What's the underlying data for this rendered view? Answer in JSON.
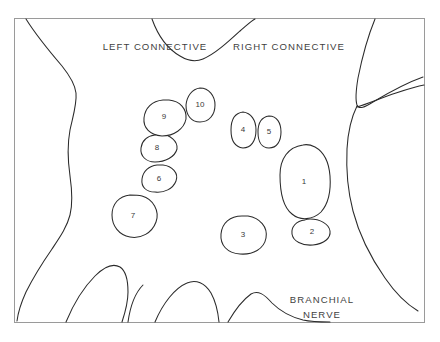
{
  "figure": {
    "background_color": "#ffffff",
    "line_color": "#2b2b2b",
    "frame_color": "#9a9a9a",
    "label_color": "#3f3f3f"
  },
  "region_labels": [
    {
      "id": "left-connective",
      "text": "LEFT CONNECTIVE",
      "x": 155,
      "y": 47
    },
    {
      "id": "right-connective",
      "text": "RIGHT CONNECTIVE",
      "x": 289,
      "y": 47
    },
    {
      "id": "branchial-nerve-line1",
      "text": "BRANCHIAL",
      "x": 322,
      "y": 300
    },
    {
      "id": "branchial-nerve-line2",
      "text": "NERVE",
      "x": 322,
      "y": 315
    }
  ],
  "blobs": [
    {
      "id": "blob-1",
      "label": "1",
      "cx": 304,
      "cy": 182,
      "path": "M 303 145 C 288 147, 280 159, 280 175 C 280 192, 283 207, 292 214 C 300 221, 313 220, 321 212 C 329 203, 331 190, 330 176 C 329 163, 324 152, 315 147 C 311 145, 307 144, 303 145 Z"
    },
    {
      "id": "blob-2",
      "label": "2",
      "cx": 312,
      "cy": 232,
      "path": "M 305 220 C 296 221, 291 227, 292 234 C 293 241, 302 246, 313 245 C 324 244, 331 238, 330 231 C 329 224, 320 219, 310 219 C 308 219, 306 219, 305 220 Z"
    },
    {
      "id": "blob-3",
      "label": "3",
      "cx": 243,
      "cy": 235,
      "path": "M 242 216 C 230 216, 222 223, 221 234 C 220 245, 227 253, 240 254 C 253 255, 264 249, 266 238 C 268 227, 260 218, 248 216 C 246 216, 244 216, 242 216 Z"
    },
    {
      "id": "blob-4",
      "label": "4",
      "cx": 243,
      "cy": 130,
      "path": "M 243 112 C 235 113, 231 120, 231 130 C 231 140, 235 147, 243 148 C 251 148, 256 141, 256 130 C 256 120, 251 113, 243 112 Z"
    },
    {
      "id": "blob-5",
      "label": "5",
      "cx": 269,
      "cy": 132,
      "path": "M 269 116 C 262 117, 258 123, 258 132 C 258 142, 262 148, 269 148 C 277 148, 281 141, 281 132 C 281 123, 277 116, 269 116 Z"
    },
    {
      "id": "blob-6",
      "label": "6",
      "cx": 159,
      "cy": 179,
      "path": "M 157 165 C 149 166, 143 171, 142 179 C 141 187, 146 192, 155 192 C 164 193, 173 189, 176 181 C 179 173, 172 166, 163 165 C 161 165, 159 165, 157 165 Z"
    },
    {
      "id": "blob-7",
      "label": "7",
      "cx": 133,
      "cy": 216,
      "path": "M 130 195 C 119 196, 112 204, 112 215 C 112 226, 119 235, 130 237 C 141 239, 152 233, 156 222 C 160 211, 153 199, 142 196 C 138 195, 134 195, 130 195 Z"
    },
    {
      "id": "blob-8",
      "label": "8",
      "cx": 157,
      "cy": 148,
      "path": "M 155 135 C 147 136, 142 141, 141 148 C 140 156, 146 162, 155 162 C 165 162, 175 157, 177 149 C 178 141, 170 135, 161 134 C 159 134, 157 134, 155 135 Z"
    },
    {
      "id": "blob-9",
      "label": "9",
      "cx": 164,
      "cy": 117,
      "path": "M 163 100 C 152 101, 145 108, 144 118 C 143 128, 150 135, 162 136 C 174 136, 184 129, 186 119 C 187 109, 180 101, 169 100 C 167 100, 165 100, 163 100 Z"
    },
    {
      "id": "blob-10",
      "label": "10",
      "cx": 200,
      "cy": 105,
      "path": "M 200 88 C 192 89, 187 96, 186 105 C 186 115, 191 122, 200 122 C 209 122, 215 115, 215 105 C 215 96, 209 88, 200 88 Z"
    }
  ],
  "contours": [
    {
      "id": "top-center-notch",
      "d": "M 152 19 C 157 33, 166 48, 180 56 C 188 61, 196 62, 203 59 C 215 54, 228 42, 240 31 C 246 26, 251 21, 255 19"
    },
    {
      "id": "left-lateral-margin",
      "d": "M 26 19 C 36 35, 50 52, 62 66 C 70 76, 75 84, 76 93 C 77 104, 73 116, 70 130 C 67 146, 68 162, 70 176 C 72 190, 73 203, 70 215 C 67 227, 60 237, 52 249 C 43 262, 33 278, 26 292 C 21 303, 18 313, 17 321"
    },
    {
      "id": "left-finger-inner",
      "d": "M 66 322 C 73 305, 83 288, 95 276 C 104 267, 113 263, 120 267 C 126 271, 128 280, 128 292 C 128 303, 125 313, 122 322"
    },
    {
      "id": "left-finger-short",
      "d": "M 128 322 C 130 308, 135 293, 143 285"
    },
    {
      "id": "center-finger-peak",
      "d": "M 155 322 C 163 303, 175 288, 187 283 C 196 279, 205 283, 211 293 C 216 302, 218 312, 219 322"
    },
    {
      "id": "center-right-mound",
      "d": "M 228 322 C 235 310, 244 299, 251 294 C 258 290, 264 294, 272 303 C 280 311, 291 317, 303 320 C 312 322, 322 322, 330 322"
    },
    {
      "id": "right-notch-upper",
      "d": "M 375 19 C 368 36, 362 58, 358 78 C 356 90, 355 99, 357 105 C 359 110, 365 107, 373 102 C 388 93, 406 83, 423 77"
    },
    {
      "id": "right-notch-lower",
      "d": "M 357 107 C 367 104, 381 98, 396 93 C 408 89, 418 86, 424 85"
    },
    {
      "id": "right-lateral-margin",
      "d": "M 357 106 C 352 116, 348 131, 347 149 C 346 170, 348 192, 353 211 C 359 234, 371 258, 385 278 C 396 294, 408 305, 418 311"
    }
  ]
}
